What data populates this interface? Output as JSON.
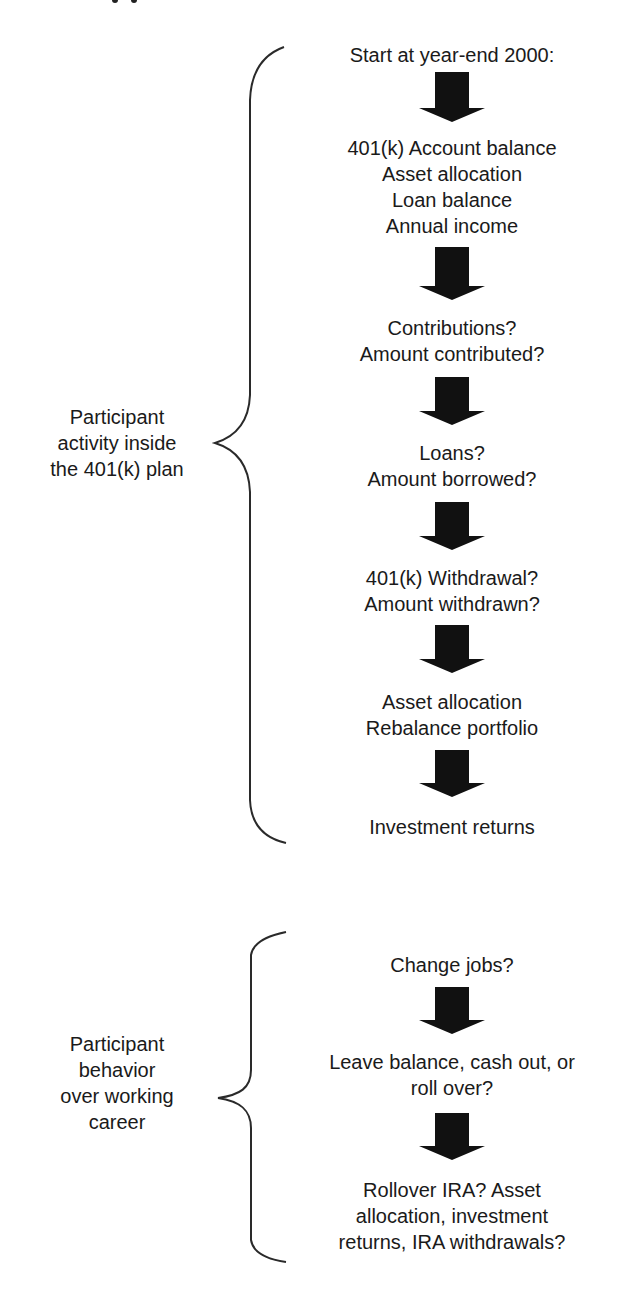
{
  "diagram": {
    "type": "flowchart",
    "sections": [
      {
        "label_lines": [
          "Participant",
          "activity inside",
          "the 401(k) plan"
        ],
        "steps": [
          {
            "lines": [
              "Start at year-end 2000:"
            ]
          },
          {
            "lines": [
              "401(k) Account balance",
              "Asset allocation",
              "Loan balance",
              "Annual income"
            ]
          },
          {
            "lines": [
              "Contributions?",
              "Amount contributed?"
            ]
          },
          {
            "lines": [
              "Loans?",
              "Amount borrowed?"
            ]
          },
          {
            "lines": [
              "401(k) Withdrawal?",
              "Amount withdrawn?"
            ]
          },
          {
            "lines": [
              "Asset allocation",
              "Rebalance portfolio"
            ]
          },
          {
            "lines": [
              "Investment returns"
            ]
          }
        ]
      },
      {
        "label_lines": [
          "Participant",
          "behavior",
          "over working",
          "career"
        ],
        "steps": [
          {
            "lines": [
              "Change jobs?"
            ]
          },
          {
            "lines": [
              "Leave balance, cash out, or",
              "roll over?"
            ]
          },
          {
            "lines": [
              "Rollover IRA? Asset",
              "allocation, investment",
              "returns, IRA withdrawals?"
            ]
          }
        ]
      }
    ],
    "arrow_icon": "down-block-arrow",
    "brace_icon": "left-curly-brace",
    "colors": {
      "ink": "#1a1a1a",
      "background": "#ffffff"
    }
  }
}
